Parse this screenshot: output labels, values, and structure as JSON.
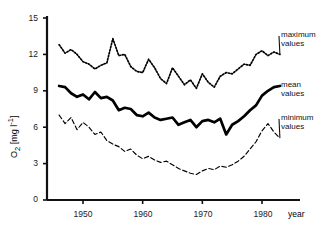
{
  "chart_data": {
    "type": "line",
    "title": "",
    "xlabel": "year",
    "ylabel": "O2 [mg l-1]",
    "ylabel_parts": {
      "symbol": "O",
      "subscript": "2",
      "unit": "[mg l",
      "exponent": "-1",
      "unit_close": "]"
    },
    "xlim": [
      1945,
      1984
    ],
    "ylim": [
      0,
      15
    ],
    "grid": false,
    "legend_position": "right-inline",
    "x_ticks": [
      1950,
      1960,
      1970,
      1980
    ],
    "x_tick_labels": [
      "1950",
      "1960",
      "1970",
      "1980"
    ],
    "y_ticks": [
      0,
      3,
      6,
      9,
      12,
      15
    ],
    "y_tick_labels": [
      "0",
      "3",
      "6",
      "9",
      "12",
      "15"
    ],
    "x": [
      1946,
      1947,
      1948,
      1949,
      1950,
      1951,
      1952,
      1953,
      1954,
      1955,
      1956,
      1957,
      1958,
      1959,
      1960,
      1961,
      1962,
      1963,
      1964,
      1965,
      1966,
      1967,
      1968,
      1969,
      1970,
      1971,
      1972,
      1973,
      1974,
      1975,
      1976,
      1977,
      1978,
      1979,
      1980,
      1981,
      1982,
      1983
    ],
    "series": [
      {
        "name": "maximum values",
        "label": "maximum\nvalues",
        "style": "dotted",
        "color": "#000000",
        "values": [
          12.8,
          12.1,
          12.4,
          12.0,
          11.4,
          11.2,
          10.8,
          11.1,
          11.3,
          13.3,
          11.9,
          12.0,
          11.0,
          10.6,
          10.5,
          11.6,
          10.9,
          10.0,
          9.6,
          10.9,
          10.2,
          9.5,
          9.9,
          9.2,
          10.4,
          9.7,
          9.3,
          10.2,
          10.5,
          10.4,
          10.8,
          11.2,
          11.1,
          12.0,
          12.3,
          11.9,
          12.2,
          12.0
        ]
      },
      {
        "name": "mean values",
        "label": "mean\nvalues",
        "style": "solid-thick",
        "color": "#000000",
        "values": [
          9.4,
          9.3,
          8.8,
          8.5,
          8.7,
          8.3,
          8.9,
          8.4,
          8.5,
          8.2,
          7.4,
          7.6,
          7.5,
          7.0,
          6.9,
          7.2,
          6.8,
          6.6,
          6.7,
          6.8,
          6.2,
          6.4,
          6.6,
          6.0,
          6.5,
          6.6,
          6.4,
          6.7,
          5.4,
          6.2,
          6.5,
          6.9,
          7.4,
          7.8,
          8.6,
          9.0,
          9.3,
          9.4
        ]
      },
      {
        "name": "minimum values",
        "label": "minimum\nvalues",
        "style": "dashed",
        "color": "#000000",
        "values": [
          7.0,
          6.3,
          6.8,
          5.8,
          6.4,
          6.0,
          5.4,
          5.6,
          4.9,
          4.6,
          4.4,
          4.0,
          4.2,
          3.7,
          3.4,
          3.6,
          3.3,
          3.1,
          3.2,
          2.9,
          2.6,
          2.4,
          2.2,
          2.1,
          2.4,
          2.6,
          2.5,
          2.8,
          2.7,
          2.9,
          3.2,
          3.6,
          4.2,
          4.8,
          5.7,
          6.3,
          5.6,
          5.1
        ]
      }
    ]
  },
  "legend": {
    "maximum": {
      "line1": "maximum",
      "line2": "values"
    },
    "mean": {
      "line1": "mean",
      "line2": "values"
    },
    "minimum": {
      "line1": "minimum",
      "line2": "values"
    }
  },
  "axis": {
    "x_title": "year"
  }
}
